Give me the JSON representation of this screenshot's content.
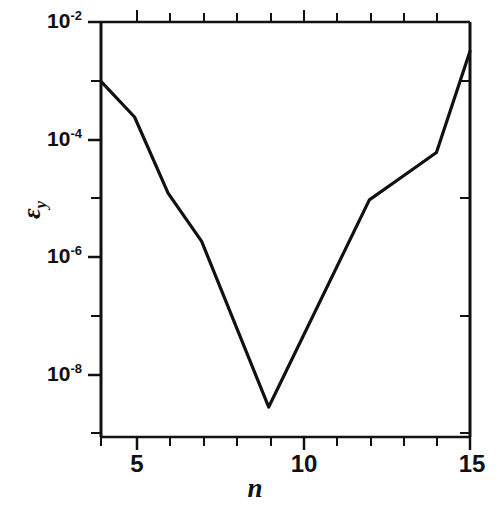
{
  "chart_data": {
    "type": "line",
    "title": "",
    "xlabel": "n",
    "ylabel": "εy",
    "ylabel_base": "ε",
    "ylabel_sub": "y",
    "x": [
      4,
      5,
      6,
      7,
      9,
      12,
      13,
      14,
      15
    ],
    "y": [
      0.001,
      0.00025,
      1.3e-05,
      2e-06,
      3.2e-09,
      1e-05,
      2.5e-05,
      6.3e-05,
      0.0032
    ],
    "series": [
      {
        "name": "epsilon_y",
        "points": [
          {
            "x": 4,
            "y": 0.001
          },
          {
            "x": 5,
            "y": 0.00025
          },
          {
            "x": 6,
            "y": 1.3e-05
          },
          {
            "x": 7,
            "y": 2e-06
          },
          {
            "x": 9,
            "y": 3.2e-09
          },
          {
            "x": 12,
            "y": 1e-05
          },
          {
            "x": 13,
            "y": 2.5e-05
          },
          {
            "x": 14,
            "y": 6.3e-05
          },
          {
            "x": 15,
            "y": 0.0032
          }
        ]
      }
    ],
    "xscale": "linear",
    "yscale": "log",
    "xlim": [
      4,
      15
    ],
    "ylim": [
      1e-09,
      0.01
    ],
    "grid": false,
    "legend": "none",
    "line_color": "#111111",
    "background_color": "#ffffff",
    "xticks": [
      5,
      10,
      15
    ],
    "xticklabels": [
      "5",
      "10",
      "15"
    ],
    "x_minor_ticks": [
      4,
      6,
      7,
      8,
      9,
      11,
      12,
      13,
      14
    ],
    "yticks": [
      0.01,
      0.0001,
      1e-06,
      1e-08
    ],
    "yticklabels": [
      {
        "mantissa": "10",
        "exponent": "-2"
      },
      {
        "mantissa": "10",
        "exponent": "-4"
      },
      {
        "mantissa": "10",
        "exponent": "-6"
      },
      {
        "mantissa": "10",
        "exponent": "-8"
      }
    ],
    "y_minor_ticks": [
      0.001,
      1e-05,
      1e-07,
      1e-09
    ]
  }
}
